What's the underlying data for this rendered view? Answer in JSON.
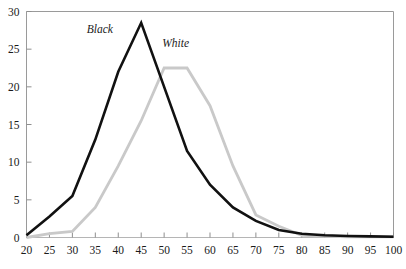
{
  "chart_data": {
    "type": "line",
    "title": "",
    "subtitle": "",
    "xlabel": "",
    "ylabel": "",
    "xlim": [
      20,
      100
    ],
    "ylim": [
      0,
      30
    ],
    "grid": false,
    "legend_position": "inline-annotation",
    "x": [
      20,
      25,
      30,
      35,
      40,
      45,
      50,
      55,
      60,
      65,
      70,
      75,
      80,
      85,
      90,
      95,
      100
    ],
    "xticks": [
      "20",
      "25",
      "30",
      "35",
      "40",
      "45",
      "50",
      "55",
      "60",
      "65",
      "70",
      "75",
      "80",
      "85",
      "90",
      "95",
      "100"
    ],
    "yticks": [
      "0",
      "5",
      "10",
      "15",
      "20",
      "25",
      "30"
    ],
    "ytick_values": [
      0,
      5,
      10,
      15,
      20,
      25,
      30
    ],
    "series": [
      {
        "name": "Black",
        "color": "#111111",
        "width": 2.6,
        "label_x": 36,
        "label_y": 27.2,
        "values": [
          0.3,
          2.8,
          5.5,
          13.0,
          22.0,
          28.5,
          20.0,
          11.5,
          7.0,
          4.0,
          2.2,
          1.0,
          0.5,
          0.3,
          0.2,
          0.15,
          0.1
        ]
      },
      {
        "name": "White",
        "color": "#c9c9c9",
        "width": 2.8,
        "label_x": 52.5,
        "label_y": 25.3,
        "values": [
          0.0,
          0.5,
          0.8,
          4.0,
          9.5,
          15.5,
          22.5,
          22.5,
          17.5,
          9.5,
          3.0,
          1.5,
          0.3,
          0.2,
          0.1,
          0.1,
          0.1
        ]
      }
    ]
  }
}
